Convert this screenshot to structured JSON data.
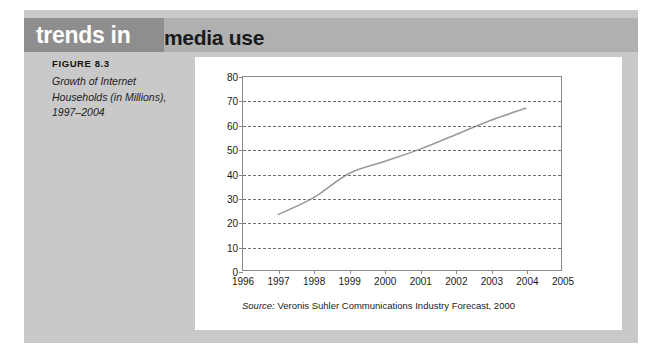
{
  "header": {
    "title_part1": "trends in",
    "title_part2": "media use",
    "band_dark_color": "#8e8e8e",
    "band_light_color": "#b0b0b0"
  },
  "figure": {
    "label": "FIGURE 8.3",
    "caption_line1": "Growth of Internet",
    "caption_line2": "Households (in Millions),",
    "caption_line3": "1997–2004"
  },
  "panel": {
    "background_color": "#c9c9c9",
    "card_color": "#ffffff"
  },
  "source": {
    "prefix": "Source:",
    "text": "Veronis Suhler Communications Industry Forecast, 2000"
  },
  "chart_data": {
    "type": "line",
    "title": "",
    "xlabel": "",
    "ylabel": "",
    "x": [
      1997,
      1998,
      1999,
      2000,
      2001,
      2002,
      2003,
      2004
    ],
    "values": [
      23,
      30,
      40,
      45,
      50,
      56,
      62,
      67
    ],
    "xtick_labels": [
      "1996",
      "1997",
      "1998",
      "1999",
      "2000",
      "2001",
      "2002",
      "2003",
      "2004",
      "2005"
    ],
    "xlim": [
      1996,
      2005
    ],
    "ytick_labels": [
      "0",
      "10",
      "20",
      "30",
      "40",
      "50",
      "60",
      "70",
      "80"
    ],
    "ylim": [
      0,
      80
    ],
    "grid": true,
    "grid_style": "dashed-horizontal",
    "legend": "none",
    "line_color": "#9a9a9a",
    "series_name": "Internet Households (in Millions)"
  }
}
